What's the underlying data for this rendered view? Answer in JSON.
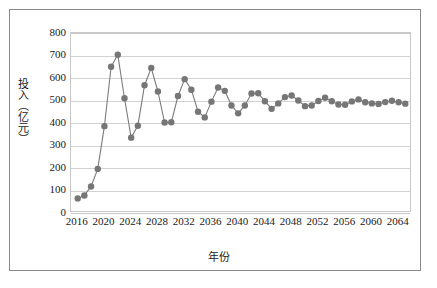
{
  "figure": {
    "has_outer_frame": true,
    "background_color": "#ffffff"
  },
  "chart_data": {
    "type": "line",
    "title": "",
    "subtitle": "",
    "xlabel": "年份",
    "ylabel": "投入（亿元）",
    "xlim": [
      2015,
      2066
    ],
    "ylim": [
      0,
      800
    ],
    "y_ticks": [
      0,
      100,
      200,
      300,
      400,
      500,
      600,
      700,
      800
    ],
    "x_ticks": [
      2016,
      2020,
      2024,
      2028,
      2032,
      2036,
      2040,
      2044,
      2048,
      2052,
      2056,
      2060,
      2064
    ],
    "y_tick_labels": [
      "0",
      "100",
      "200",
      "300",
      "400",
      "500",
      "600",
      "700",
      "800"
    ],
    "x_tick_labels": [
      "2016",
      "2020",
      "2024",
      "2028",
      "2032",
      "2036",
      "2040",
      "2044",
      "2048",
      "2052",
      "2056",
      "2060",
      "2064"
    ],
    "grid": true,
    "grid_axis": "y",
    "grid_color": "#d2d2d2",
    "legend": false,
    "legend_position": "none",
    "marker": "circle",
    "marker_size": 4.2,
    "line_width": 1.1,
    "series_color": "#7b7b7b",
    "marker_color": "#767676",
    "x": [
      2016,
      2017,
      2018,
      2019,
      2020,
      2021,
      2022,
      2023,
      2024,
      2025,
      2026,
      2027,
      2028,
      2029,
      2030,
      2031,
      2032,
      2033,
      2034,
      2035,
      2036,
      2037,
      2038,
      2039,
      2040,
      2041,
      2042,
      2043,
      2044,
      2045,
      2046,
      2047,
      2048,
      2049,
      2050,
      2051,
      2052,
      2053,
      2054,
      2055,
      2056,
      2057,
      2058,
      2059,
      2060,
      2061,
      2062,
      2063,
      2064,
      2065
    ],
    "series": [
      {
        "name": "投入",
        "values": [
          65,
          78,
          118,
          196,
          386,
          650,
          703,
          510,
          335,
          388,
          568,
          645,
          540,
          402,
          403,
          520,
          595,
          548,
          450,
          425,
          495,
          558,
          543,
          478,
          443,
          478,
          531,
          532,
          497,
          463,
          487,
          515,
          522,
          500,
          475,
          478,
          498,
          512,
          497,
          482,
          481,
          496,
          505,
          492,
          487,
          485,
          493,
          499,
          492,
          486
        ]
      }
    ]
  }
}
